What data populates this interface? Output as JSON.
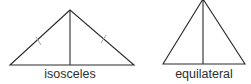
{
  "diagram": {
    "type": "triangle-comparison",
    "figures": [
      {
        "id": "isosceles",
        "label": "isosceles",
        "apex": [
          70,
          10
        ],
        "base_left": [
          10,
          65
        ],
        "base_right": [
          134,
          65
        ],
        "altitude_foot": [
          70,
          65
        ],
        "equal_side_ticks": true
      },
      {
        "id": "equilateral",
        "label": "equilateral",
        "apex": [
          203,
          0
        ],
        "base_left": [
          163,
          64
        ],
        "base_right": [
          245,
          64
        ],
        "altitude_foot": [
          203,
          64
        ],
        "equal_side_ticks": false
      }
    ],
    "colors": {
      "line": "#2a2a2a",
      "tick": "#9a9a9a",
      "text": "#2e2e2e",
      "background": "#ffffff"
    }
  }
}
